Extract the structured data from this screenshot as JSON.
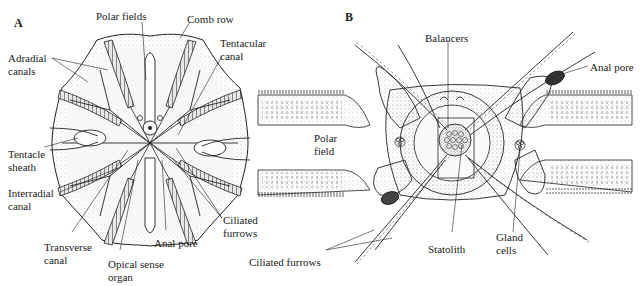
{
  "figure": {
    "panel_a": {
      "letter": "A",
      "labels": {
        "polar_fields": "Polar fields",
        "comb_row": "Comb row",
        "tentacular_canal_1": "Tentacular",
        "tentacular_canal_2": "canal",
        "adradial_canals_1": "Adradial",
        "adradial_canals_2": "canals",
        "tentacle_sheath_1": "Tentacle",
        "tentacle_sheath_2": "sheath",
        "interradial_canal_1": "Interradial",
        "interradial_canal_2": "canal",
        "transverse_canal_1": "Transverse",
        "transverse_canal_2": "canal",
        "opical_sense_organ_1": "Opical sense",
        "opical_sense_organ_2": "organ",
        "anal_pore": "Anal pore",
        "ciliated_furrows_1": "Ciliated",
        "ciliated_furrows_2": "furrows"
      }
    },
    "panel_b": {
      "letter": "B",
      "labels": {
        "balancers": "Balancers",
        "anal_pore": "Anal pore",
        "polar_field_1": "Polar",
        "polar_field_2": "field",
        "statolith": "Statolith",
        "gland_cells_1": "Gland",
        "gland_cells_2": "cells",
        "ciliated_furrows": "Ciliated furrows"
      }
    }
  }
}
